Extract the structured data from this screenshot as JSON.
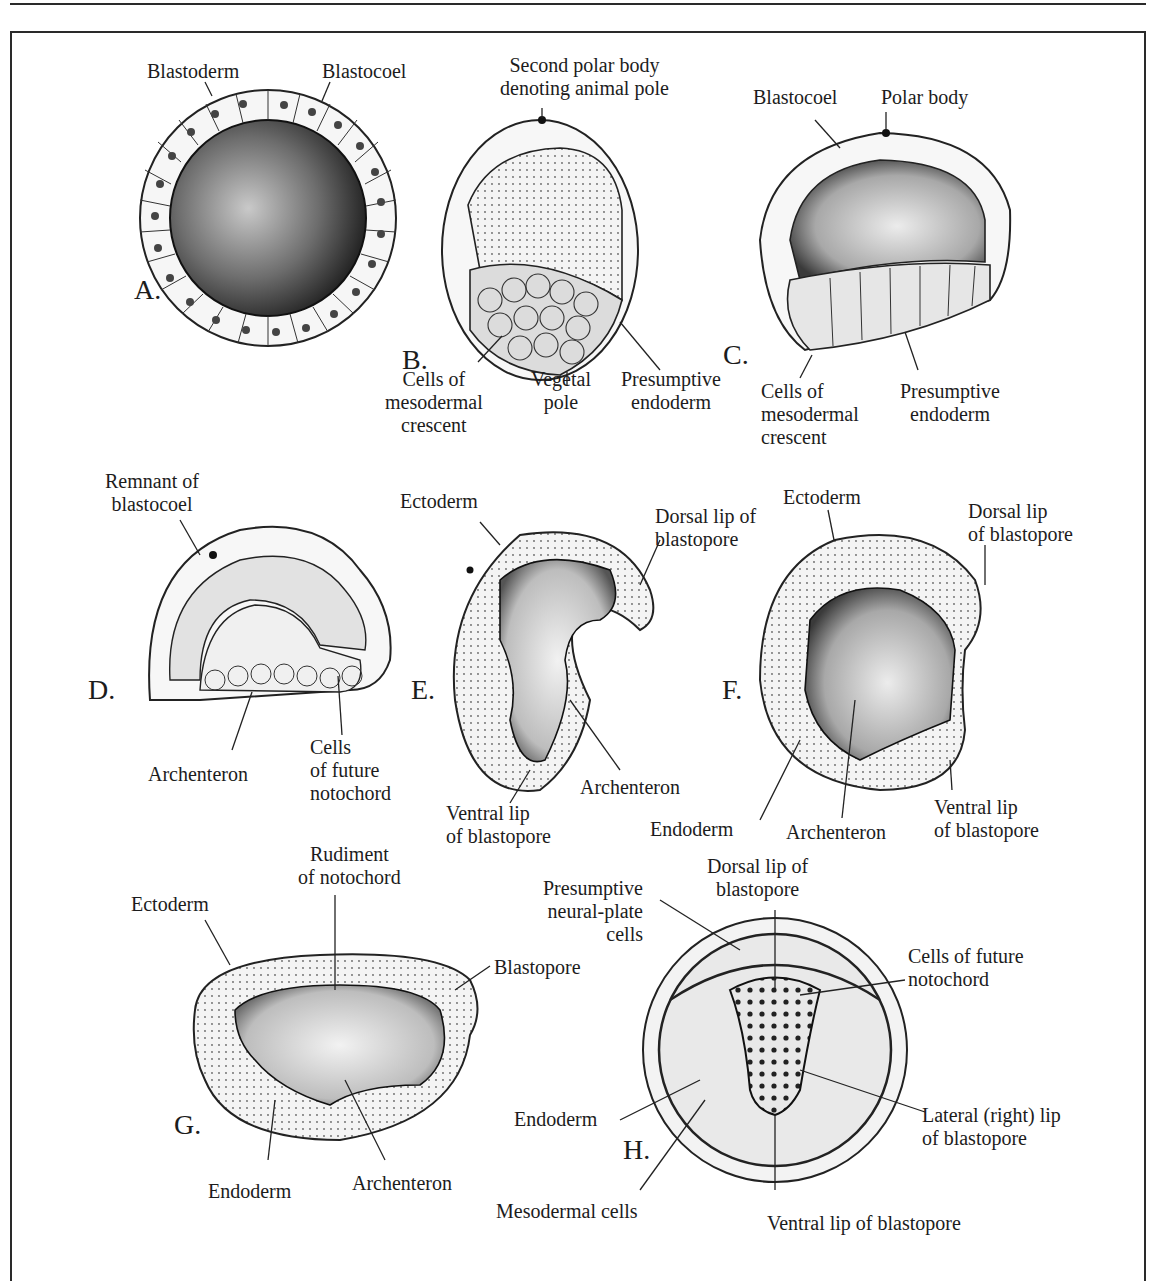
{
  "figure": {
    "panels": [
      {
        "letter": "A.",
        "labels": [
          "Blastoderm",
          "Blastocoel"
        ]
      },
      {
        "letter": "B.",
        "labels": [
          "Second polar body\ndenoting animal pole",
          "Cells of\nmesodermal\ncrescent",
          "Vegetal\npole",
          "Presumptive\nendoderm"
        ]
      },
      {
        "letter": "C.",
        "labels": [
          "Blastocoel",
          "Polar body",
          "Cells of\nmesodermal\ncrescent",
          "Presumptive\nendoderm"
        ]
      },
      {
        "letter": "D.",
        "labels": [
          "Remnant of\nblastocoel",
          "Archenteron",
          "Cells\nof future\nnotochord"
        ]
      },
      {
        "letter": "E.",
        "labels": [
          "Ectoderm",
          "Dorsal lip of\nblastopore",
          "Ventral lip\nof blastopore",
          "Archenteron"
        ]
      },
      {
        "letter": "F.",
        "labels": [
          "Ectoderm",
          "Dorsal lip\nof blastopore",
          "Endoderm",
          "Archenteron",
          "Ventral lip\nof blastopore"
        ]
      },
      {
        "letter": "G.",
        "labels": [
          "Rudiment\nof notochord",
          "Ectoderm",
          "Blastopore",
          "Endoderm",
          "Archenteron"
        ]
      },
      {
        "letter": "H.",
        "labels": [
          "Presumptive\nneural-plate\ncells",
          "Dorsal lip of\nblastopore",
          "Cells of future\nnotochord",
          "Endoderm",
          "Lateral (right) lip\nof blastopore",
          "Mesodermal cells",
          "Ventral lip of blastopore"
        ]
      }
    ]
  }
}
